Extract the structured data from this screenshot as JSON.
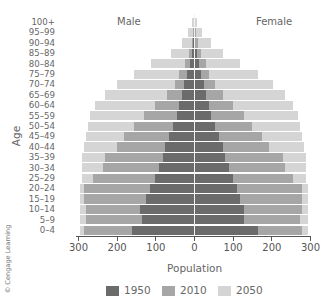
{
  "chart_data": {
    "type": "bar",
    "orientation": "horizontal-population-pyramid",
    "title": "",
    "xlabel": "Population",
    "ylabel": "Age",
    "side_labels": {
      "left": "Male",
      "right": "Female"
    },
    "xlim": [
      -300,
      300
    ],
    "x_ticks": [
      300,
      200,
      100,
      0,
      100,
      200,
      300
    ],
    "categories": [
      "0–4",
      "5–9",
      "10–14",
      "15–19",
      "20–24",
      "25–29",
      "30–34",
      "35–39",
      "40–44",
      "45–49",
      "50–54",
      "55–59",
      "60–64",
      "65–69",
      "70–74",
      "75–79",
      "80–84",
      "85–89",
      "90–94",
      "95–99",
      "100+"
    ],
    "series": [
      {
        "name": "1950",
        "color": "#6b6b6b",
        "male": [
          160,
          135,
          140,
          125,
          115,
          100,
          90,
          80,
          75,
          65,
          55,
          45,
          40,
          30,
          25,
          18,
          10,
          5,
          2,
          1,
          0
        ],
        "female": [
          165,
          130,
          130,
          120,
          110,
          100,
          90,
          80,
          75,
          65,
          55,
          45,
          40,
          32,
          25,
          18,
          12,
          8,
          3,
          1,
          0
        ]
      },
      {
        "name": "2010",
        "color": "#a6a6a6",
        "male": [
          285,
          280,
          280,
          285,
          285,
          260,
          235,
          230,
          200,
          180,
          155,
          130,
          100,
          70,
          50,
          38,
          22,
          12,
          6,
          2,
          1
        ],
        "female": [
          280,
          275,
          280,
          280,
          280,
          255,
          235,
          230,
          195,
          175,
          150,
          130,
          100,
          75,
          55,
          40,
          30,
          18,
          10,
          4,
          1
        ]
      },
      {
        "name": "2050",
        "color": "#d5d5d5",
        "male": [
          295,
          295,
          295,
          295,
          295,
          290,
          290,
          290,
          285,
          280,
          275,
          270,
          255,
          230,
          200,
          155,
          110,
          60,
          30,
          15,
          5
        ],
        "female": [
          295,
          295,
          295,
          295,
          295,
          290,
          290,
          290,
          285,
          280,
          275,
          270,
          255,
          235,
          205,
          165,
          120,
          75,
          45,
          20,
          8
        ]
      }
    ],
    "legend": [
      "1950",
      "2010",
      "2050"
    ],
    "legend_position": "bottom",
    "grid": false
  },
  "labels": {
    "male": "Male",
    "female": "Female",
    "ylabel": "Age",
    "xlabel": "Population",
    "credit": "© Cengage Learning"
  },
  "ticks": [
    "300",
    "200",
    "100",
    "0",
    "100",
    "200",
    "300"
  ],
  "legend": [
    {
      "label": "1950",
      "color": "#6b6b6b"
    },
    {
      "label": "2010",
      "color": "#a6a6a6"
    },
    {
      "label": "2050",
      "color": "#d5d5d5"
    }
  ]
}
